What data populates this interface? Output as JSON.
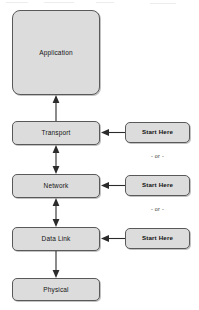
{
  "diagram": {
    "background_color": "#ffffff",
    "box_fill_color": "#dcdcdc",
    "box_border_color": "#595959",
    "connector_color": "#2b2b2b",
    "layers": [
      {
        "id": "application",
        "label": "Application"
      },
      {
        "id": "transport",
        "label": "Transport"
      },
      {
        "id": "network",
        "label": "Network"
      },
      {
        "id": "data-link",
        "label": "Data Link"
      },
      {
        "id": "physical",
        "label": "Physical"
      }
    ],
    "entry_points": [
      {
        "id": "start-here-transport",
        "label": "Start Here",
        "target": "transport"
      },
      {
        "id": "start-here-network",
        "label": "Start Here",
        "target": "network"
      },
      {
        "id": "start-here-data-link",
        "label": "Start Here",
        "target": "data-link"
      }
    ],
    "separators": [
      {
        "id": "or-1",
        "label": "- or -"
      },
      {
        "id": "or-2",
        "label": "- or -"
      }
    ],
    "connectors": [
      {
        "id": "transport-to-application",
        "from": "transport",
        "to": "application",
        "direction": "up"
      },
      {
        "id": "transport-network",
        "from": "transport",
        "to": "network",
        "direction": "both"
      },
      {
        "id": "network-data-link",
        "from": "network",
        "to": "data-link",
        "direction": "both"
      },
      {
        "id": "data-link-to-physical",
        "from": "data-link",
        "to": "physical",
        "direction": "down"
      }
    ]
  }
}
